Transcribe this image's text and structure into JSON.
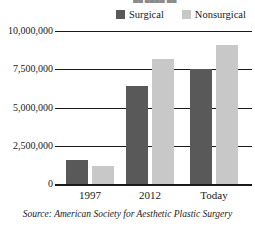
{
  "chart_data": {
    "type": "bar",
    "title": "",
    "xlabel": "",
    "ylabel": "",
    "categories": [
      "1997",
      "2012",
      "Today"
    ],
    "series": [
      {
        "name": "Surgical",
        "color": "#595959",
        "values": [
          1600000,
          6400000,
          7500000
        ]
      },
      {
        "name": "Nonsurgical",
        "color": "#c8c8c8",
        "values": [
          1200000,
          8200000,
          9100000
        ]
      }
    ],
    "ylim": [
      0,
      10000000
    ],
    "ytick_values": [
      0,
      2500000,
      5000000,
      7500000,
      10000000
    ],
    "ytick_labels": [
      "0",
      "2,500,000",
      "5,000,000",
      "7,500,000",
      "10,000,000"
    ],
    "grid": true,
    "legend_position": "top",
    "annotations": [
      "Source: American Society for Aesthetic Plastic Surgery"
    ]
  },
  "legend": {
    "items": [
      {
        "label": "Surgical",
        "color": "#595959"
      },
      {
        "label": "Nonsurgical",
        "color": "#c8c8c8"
      }
    ]
  },
  "axis": {
    "y_labels": [
      "10,000,000",
      "7,500,000",
      "5,000,000",
      "2,500,000",
      "0"
    ],
    "x_labels": [
      "1997",
      "2012",
      "Today"
    ]
  },
  "source": {
    "prefix": "Source:",
    "text": "Source: American Society for Aesthetic Plastic Surgery",
    "organization": "American Society for Aesthetic Plastic Surgery"
  },
  "title_sliver": "██ ████ ██"
}
